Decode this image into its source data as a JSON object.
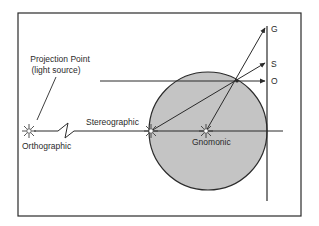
{
  "diagram": {
    "labels": {
      "projection_point_line1": "Projection Point",
      "projection_point_line2": "(light source)",
      "orthographic": "Orthographic",
      "stereographic": "Stereographic",
      "gnomonic": "Gnomonic",
      "G": "G",
      "S": "S",
      "O": "O"
    },
    "colors": {
      "globe_fill": "#c4c4c4",
      "stroke": "#2a2a2a",
      "background": "#ffffff"
    }
  }
}
